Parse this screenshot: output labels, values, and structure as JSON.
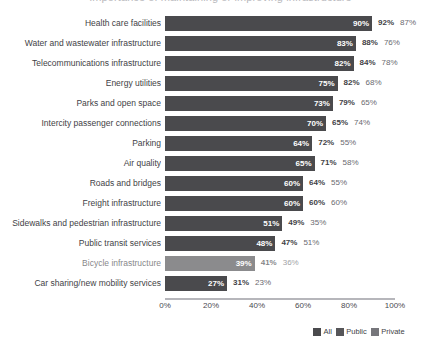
{
  "title_cropped": "Importance of maintaining or improving infrastructure",
  "legend": {
    "items": [
      {
        "label": "All",
        "color": "#4a4a4d",
        "icon": "legend-swatch"
      },
      {
        "label": "Public",
        "color": "#565659",
        "icon": "legend-swatch"
      },
      {
        "label": "Private",
        "color": "#76767b",
        "icon": "legend-swatch"
      }
    ]
  },
  "axis": {
    "ticks": [
      "0%",
      "20%",
      "40%",
      "60%",
      "80%",
      "100%"
    ]
  },
  "chart_data": {
    "type": "bar",
    "orientation": "horizontal",
    "title": "Importance of maintaining or improving infrastructure",
    "xlabel": "",
    "ylabel": "",
    "xlim": [
      0,
      100
    ],
    "xticks": [
      0,
      20,
      40,
      60,
      80,
      100
    ],
    "xtick_labels": [
      "0%",
      "20%",
      "40%",
      "60%",
      "80%",
      "100%"
    ],
    "grid": false,
    "legend_position": "bottom-right",
    "value_suffix": "%",
    "categories": [
      "Health care facilities",
      "Water and wastewater infrastructure",
      "Telecommunications infrastructure",
      "Energy utilities",
      "Parks and open space",
      "Intercity passenger connections",
      "Parking",
      "Air quality",
      "Roads and bridges",
      "Freight infrastructure",
      "Sidewalks and pedestrian infrastructure",
      "Public transit services",
      "Bicycle infrastructure",
      "Car sharing/new mobility services"
    ],
    "series": [
      {
        "name": "All",
        "rendered_as": "bar",
        "values": [
          90,
          83,
          82,
          75,
          73,
          70,
          64,
          65,
          60,
          60,
          51,
          48,
          39,
          27
        ],
        "labels": [
          "90%",
          "83%",
          "82%",
          "75%",
          "73%",
          "70%",
          "64%",
          "65%",
          "60%",
          "60%",
          "51%",
          "48%",
          "39%",
          "27%"
        ]
      },
      {
        "name": "Public",
        "rendered_as": "text",
        "values": [
          92,
          88,
          84,
          82,
          79,
          65,
          72,
          71,
          64,
          60,
          49,
          47,
          41,
          31
        ],
        "labels": [
          "92%",
          "88%",
          "84%",
          "82%",
          "79%",
          "65%",
          "72%",
          "71%",
          "64%",
          "60%",
          "49%",
          "47%",
          "41%",
          "31%"
        ]
      },
      {
        "name": "Private",
        "rendered_as": "text",
        "values": [
          87,
          76,
          78,
          68,
          65,
          74,
          55,
          58,
          55,
          60,
          35,
          51,
          36,
          23
        ],
        "labels": [
          "87%",
          "76%",
          "78%",
          "68%",
          "65%",
          "74%",
          "55%",
          "58%",
          "55%",
          "60%",
          "35%",
          "51%",
          "36%",
          "23%"
        ]
      }
    ]
  }
}
